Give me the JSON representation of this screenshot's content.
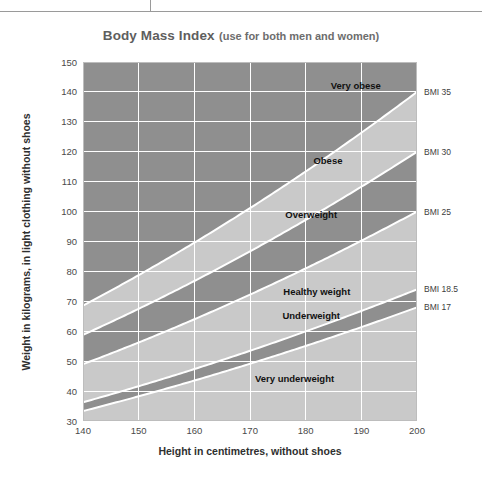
{
  "title": {
    "main": "Body Mass Index",
    "parenthetical": "(use for both men and women)"
  },
  "axes": {
    "x_title": "Height in centimetres, without shoes",
    "y_title": "Weight in kilograms, in light clothing without shoes",
    "x_ticks": [
      "140",
      "150",
      "160",
      "170",
      "180",
      "190",
      "200"
    ],
    "y_ticks": [
      "150",
      "140",
      "130",
      "120",
      "110",
      "100",
      "90",
      "80",
      "70",
      "60",
      "50",
      "40",
      "30"
    ]
  },
  "bmi_labels": [
    {
      "text": "BMI 35",
      "bmi": 35
    },
    {
      "text": "BMI 30",
      "bmi": 30
    },
    {
      "text": "BMI 25",
      "bmi": 25
    },
    {
      "text": "BMI 18.5",
      "bmi": 18.5
    },
    {
      "text": "BMI 17",
      "bmi": 17
    }
  ],
  "band_labels": [
    {
      "text": "Very obese",
      "height_cm": 189,
      "weight_kg": 141
    },
    {
      "text": "Obese",
      "height_cm": 184,
      "weight_kg": 116
    },
    {
      "text": "Overweight",
      "height_cm": 181,
      "weight_kg": 98
    },
    {
      "text": "Healthy weight",
      "height_cm": 182,
      "weight_kg": 72
    },
    {
      "text": "Underweight",
      "height_cm": 181,
      "weight_kg": 64
    },
    {
      "text": "Very underweight",
      "height_cm": 178,
      "weight_kg": 43
    }
  ],
  "colors": {
    "band_dark": "#8f8f8f",
    "band_light": "#c9c9c9",
    "grid": "#ffffff",
    "boundary": "#ffffff",
    "plot_background": "#8f8f8f",
    "rule": "#9a9a9a",
    "title": "#5e5e5e",
    "axis_text": "#4a4a4a"
  },
  "chart_data": {
    "type": "area",
    "title": "Body Mass Index (use for both men and women)",
    "xlabel": "Height in centimetres, without shoes",
    "ylabel": "Weight in kilograms, in light clothing without shoes",
    "xlim": [
      140,
      200
    ],
    "ylim": [
      30,
      150
    ],
    "xticks": [
      140,
      150,
      160,
      170,
      180,
      190,
      200
    ],
    "yticks": [
      30,
      40,
      50,
      60,
      70,
      80,
      90,
      100,
      110,
      120,
      130,
      140,
      150
    ],
    "grid": true,
    "legend": "none",
    "formula": "weight_kg = BMI * (height_cm/100)^2",
    "boundaries": [
      {
        "bmi": 17,
        "label": "BMI 17",
        "weights_at_xticks": [
          33.3,
          38.3,
          43.5,
          49.1,
          55.1,
          61.4,
          68.0
        ]
      },
      {
        "bmi": 18.5,
        "label": "BMI 18.5",
        "weights_at_xticks": [
          36.3,
          41.6,
          47.4,
          53.5,
          59.9,
          66.8,
          74.0
        ]
      },
      {
        "bmi": 25,
        "label": "BMI 25",
        "weights_at_xticks": [
          49.0,
          56.3,
          64.0,
          72.3,
          81.0,
          90.3,
          100.0
        ]
      },
      {
        "bmi": 30,
        "label": "BMI 30",
        "weights_at_xticks": [
          58.8,
          67.5,
          76.8,
          86.7,
          97.2,
          108.3,
          120.0
        ]
      },
      {
        "bmi": 35,
        "label": "BMI 35",
        "weights_at_xticks": [
          68.6,
          78.8,
          89.6,
          101.2,
          113.4,
          126.4,
          140.0
        ]
      }
    ],
    "bands": [
      {
        "name": "Very underweight",
        "bmi_range": [
          0,
          17
        ],
        "shade": "light"
      },
      {
        "name": "Underweight",
        "bmi_range": [
          17,
          18.5
        ],
        "shade": "dark"
      },
      {
        "name": "Healthy weight",
        "bmi_range": [
          18.5,
          25
        ],
        "shade": "light"
      },
      {
        "name": "Overweight",
        "bmi_range": [
          25,
          30
        ],
        "shade": "dark"
      },
      {
        "name": "Obese",
        "bmi_range": [
          30,
          35
        ],
        "shade": "light"
      },
      {
        "name": "Very obese",
        "bmi_range": [
          35,
          99
        ],
        "shade": "dark"
      }
    ]
  }
}
